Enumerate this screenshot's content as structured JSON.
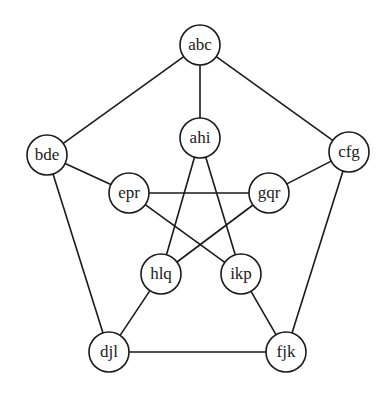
{
  "diagram": {
    "type": "graph",
    "style": {
      "stroke": "#1a1a1a",
      "fill": "#ffffff",
      "radius": 20
    },
    "nodes": [
      {
        "id": "abc",
        "label": "abc",
        "x": 200,
        "y": 45
      },
      {
        "id": "ahi",
        "label": "ahi",
        "x": 200,
        "y": 138
      },
      {
        "id": "bde",
        "label": "bde",
        "x": 47,
        "y": 155
      },
      {
        "id": "cfg",
        "label": "cfg",
        "x": 349,
        "y": 152
      },
      {
        "id": "epr",
        "label": "epr",
        "x": 129,
        "y": 193
      },
      {
        "id": "gqr",
        "label": "gqr",
        "x": 269,
        "y": 193
      },
      {
        "id": "hlq",
        "label": "hlq",
        "x": 161,
        "y": 274
      },
      {
        "id": "ikp",
        "label": "ikp",
        "x": 241,
        "y": 274
      },
      {
        "id": "djl",
        "label": "djl",
        "x": 109,
        "y": 352
      },
      {
        "id": "fjk",
        "label": "fjk",
        "x": 286,
        "y": 352
      }
    ],
    "edges": [
      [
        "abc",
        "bde"
      ],
      [
        "abc",
        "cfg"
      ],
      [
        "abc",
        "ahi"
      ],
      [
        "bde",
        "epr"
      ],
      [
        "bde",
        "djl"
      ],
      [
        "cfg",
        "gqr"
      ],
      [
        "cfg",
        "fjk"
      ],
      [
        "epr",
        "gqr"
      ],
      [
        "epr",
        "ikp"
      ],
      [
        "gqr",
        "hlq"
      ],
      [
        "ahi",
        "hlq"
      ],
      [
        "ahi",
        "ikp"
      ],
      [
        "hlq",
        "djl"
      ],
      [
        "ikp",
        "fjk"
      ],
      [
        "djl",
        "fjk"
      ]
    ]
  }
}
